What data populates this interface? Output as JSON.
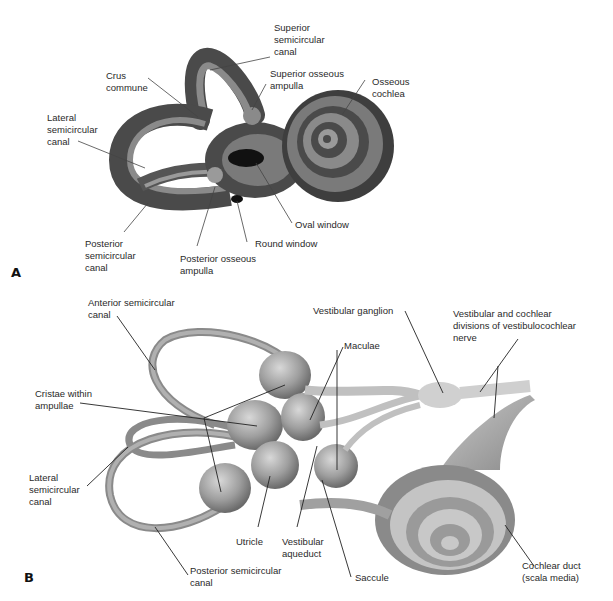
{
  "figure": {
    "panels": [
      {
        "letter": "A",
        "labels": {
          "superior_semicircular_canal": "Superior\nsemicircular\ncanal",
          "crus_commune": "Crus\ncommune",
          "superior_osseous_ampulla": "Superior osseous\nampulla",
          "osseous_cochlea": "Osseous\ncochlea",
          "lateral_semicircular_canal": "Lateral\nsemicircular\ncanal",
          "oval_window": "Oval window",
          "round_window": "Round window",
          "posterior_semicircular_canal": "Posterior\nsemicircular\ncanal",
          "posterior_osseous_ampulla": "Posterior osseous\nampulla"
        }
      },
      {
        "letter": "B",
        "labels": {
          "anterior_semicircular_canal": "Anterior semicircular\ncanal",
          "vestibular_ganglion": "Vestibular ganglion",
          "vestibular_cochlear_divisions": "Vestibular and cochlear\ndivisions of vestibulocochlear\nnerve",
          "maculae": "Maculae",
          "cristae_within_ampullae": "Cristae within\nampullae",
          "lateral_semicircular_canal": "Lateral\nsemicircular\ncanal",
          "utricle": "Utricle",
          "vestibular_aqueduct": "Vestibular\naqueduct",
          "saccule": "Saccule",
          "posterior_semicircular_canal": "Posterior semicircular\ncanal",
          "cochlear_duct": "Cochlear duct\n(scala media)"
        }
      }
    ]
  },
  "colors": {
    "bone_dark": "#4a4a4a",
    "bone_mid": "#6e6e6e",
    "bone_light": "#9a9a9a",
    "membrane": "#a8a8a8",
    "membrane_light": "#cfcfcf",
    "leader_line": "#222222"
  }
}
